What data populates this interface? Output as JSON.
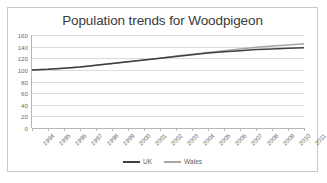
{
  "chart_data": {
    "type": "line",
    "title": "Population trends for Woodpigeon",
    "xlabel": "",
    "ylabel": "",
    "grid": true,
    "legend_position": "bottom",
    "ylim": [
      0,
      160
    ],
    "ytick_labels": [
      "160",
      "140",
      "120",
      "100",
      "80",
      "60",
      "40",
      "20",
      "0"
    ],
    "ytick_values": [
      160,
      140,
      120,
      100,
      80,
      60,
      40,
      20,
      0
    ],
    "categories": [
      "1994",
      "1995",
      "1996",
      "1997",
      "1998",
      "1999",
      "2000",
      "2001",
      "2002",
      "2003",
      "2004",
      "2005",
      "2006",
      "2007",
      "2008",
      "2009",
      "2010",
      "2011"
    ],
    "series": [
      {
        "name": "UK",
        "color": "#404040",
        "values": [
          100,
          101,
          103,
          105,
          108,
          111,
          114,
          117,
          120,
          123,
          126,
          129,
          131,
          133,
          135,
          136,
          137,
          138
        ]
      },
      {
        "name": "Wales",
        "color": "#a6a6a6",
        "values": [
          100,
          101,
          103,
          105,
          108,
          111,
          114,
          117,
          120,
          124,
          127,
          130,
          133,
          136,
          139,
          141,
          143,
          145
        ]
      }
    ]
  },
  "style": {
    "frame_border": "#c9c9c9",
    "grid_color": "#dadada",
    "axis_color": "#b6b6b6",
    "tick_text": "#6d6d6d",
    "title_text": "#3a3a3a",
    "legend_text": "#5f5f5f",
    "background": "#ffffff"
  }
}
